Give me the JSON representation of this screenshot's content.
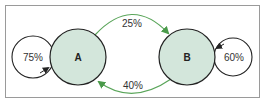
{
  "diagram": {
    "type": "state-transition",
    "colors": {
      "frame": "#9a9a9a",
      "state_fill": "#d3e6db",
      "state_stroke": "#222222",
      "transition": "#5aa55a",
      "self_loop": "#222222"
    },
    "states": [
      {
        "id": "A",
        "label": "A",
        "self_loop": "75%"
      },
      {
        "id": "B",
        "label": "B",
        "self_loop": "60%"
      }
    ],
    "transitions": [
      {
        "from": "A",
        "to": "B",
        "label": "25%"
      },
      {
        "from": "B",
        "to": "A",
        "label": "40%"
      }
    ]
  }
}
